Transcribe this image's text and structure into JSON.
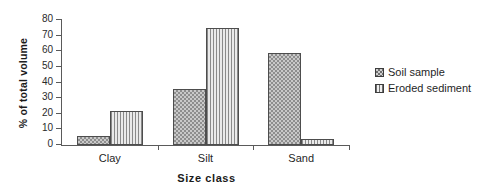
{
  "chart_data": {
    "type": "bar",
    "title": "",
    "xlabel": "Size class",
    "ylabel": "% of total volume",
    "categories": [
      "Clay",
      "Silt",
      "Sand"
    ],
    "series": [
      {
        "name": "Soil sample",
        "values": [
          6,
          36,
          59
        ]
      },
      {
        "name": "Eroded sediment",
        "values": [
          22,
          75,
          4
        ]
      }
    ],
    "ylim": [
      0,
      80
    ],
    "ytick_labels": [
      "0",
      "10",
      "20",
      "30",
      "40",
      "50",
      "60",
      "70",
      "80"
    ],
    "ytick_values": [
      0,
      10,
      20,
      30,
      40,
      50,
      60,
      70,
      80
    ],
    "grid": false,
    "legend_position": "right",
    "legend_entries": [
      "Soil sample",
      "Eroded sediment"
    ],
    "fill_patterns": [
      "checkerboard",
      "vertical-stripes"
    ],
    "colors": {
      "axis": "#5a5a5a",
      "text": "#1a1a1a",
      "soil_sample_fill": "#c9c9c9",
      "soil_sample_pattern": "#8e8e8e",
      "eroded_sediment_fill": "#d8d8d8",
      "eroded_sediment_pattern": "#8a8a8a",
      "bar_border": "#4d4d4d",
      "background": "#ffffff"
    }
  }
}
